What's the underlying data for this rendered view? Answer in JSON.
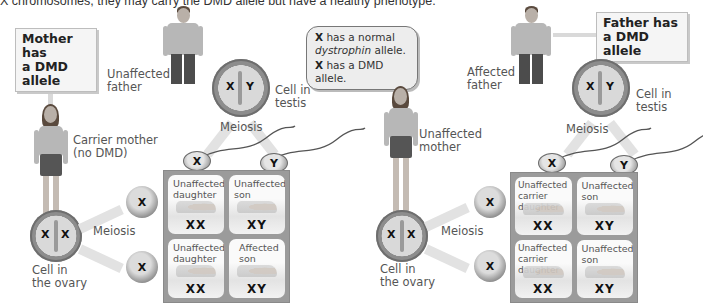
{
  "caption": "X chromosomes, they may carry the DMD allele but have a healthy phenotype.",
  "legend": {
    "line1_symbol": "X",
    "line1_text_a": "has a normal",
    "line1_text_b_italic": "dystrophin",
    "line1_text_c": "allele.",
    "line2_symbol": "X",
    "line2_text": "has a DMD allele."
  },
  "left_panel": {
    "callout": {
      "line1": "Mother has",
      "line2": "a DMD allele"
    },
    "father_label": {
      "line1": "Unaffected",
      "line2": "father"
    },
    "mother_label": {
      "line1": "Carrier mother",
      "line2": "(no DMD)"
    },
    "testis_cell": {
      "chromosomes": [
        "X",
        "Y"
      ],
      "label_line1": "Cell in",
      "label_line2": "testis"
    },
    "testis_meiosis": "Meiosis",
    "sperm": [
      "X",
      "Y"
    ],
    "ovary_cell": {
      "chromosomes": [
        "X",
        "X"
      ],
      "label_line1": "Cell in",
      "label_line2": "the ovary"
    },
    "ovary_meiosis": "Meiosis",
    "eggs": [
      "X",
      "X"
    ],
    "punnett": [
      {
        "label_line1": "Unaffected",
        "label_line2": "daughter",
        "genotype": "XX"
      },
      {
        "label_line1": "Unaffected",
        "label_line2": "son",
        "genotype": "XY"
      },
      {
        "label_line1": "Unaffected",
        "label_line2": "daughter",
        "genotype": "XX"
      },
      {
        "label_line1": "Affected",
        "label_line2": "son",
        "genotype": "XY"
      }
    ]
  },
  "right_panel": {
    "callout": {
      "line1": "Father has",
      "line2": "a DMD allele"
    },
    "father_label": {
      "line1": "Affected",
      "line2": "father"
    },
    "mother_label": {
      "line1": "Unaffected",
      "line2": "mother"
    },
    "testis_cell": {
      "chromosomes": [
        "X",
        "Y"
      ],
      "label_line1": "Cell in",
      "label_line2": "testis"
    },
    "testis_meiosis": "Meiosis",
    "sperm": [
      "X",
      "Y"
    ],
    "ovary_cell": {
      "chromosomes": [
        "X",
        "X"
      ],
      "label_line1": "Cell in",
      "label_line2": "the ovary"
    },
    "ovary_meiosis": "Meiosis",
    "eggs": [
      "X",
      "X"
    ],
    "punnett": [
      {
        "label_line1": "Unaffected",
        "label_line2": "carrier daughter",
        "genotype": "XX"
      },
      {
        "label_line1": "Unaffected",
        "label_line2": "son",
        "genotype": "XY"
      },
      {
        "label_line1": "Unaffected",
        "label_line2": "carrier daughter",
        "genotype": "XX"
      },
      {
        "label_line1": "Unaffected",
        "label_line2": "son",
        "genotype": "XY"
      }
    ]
  }
}
